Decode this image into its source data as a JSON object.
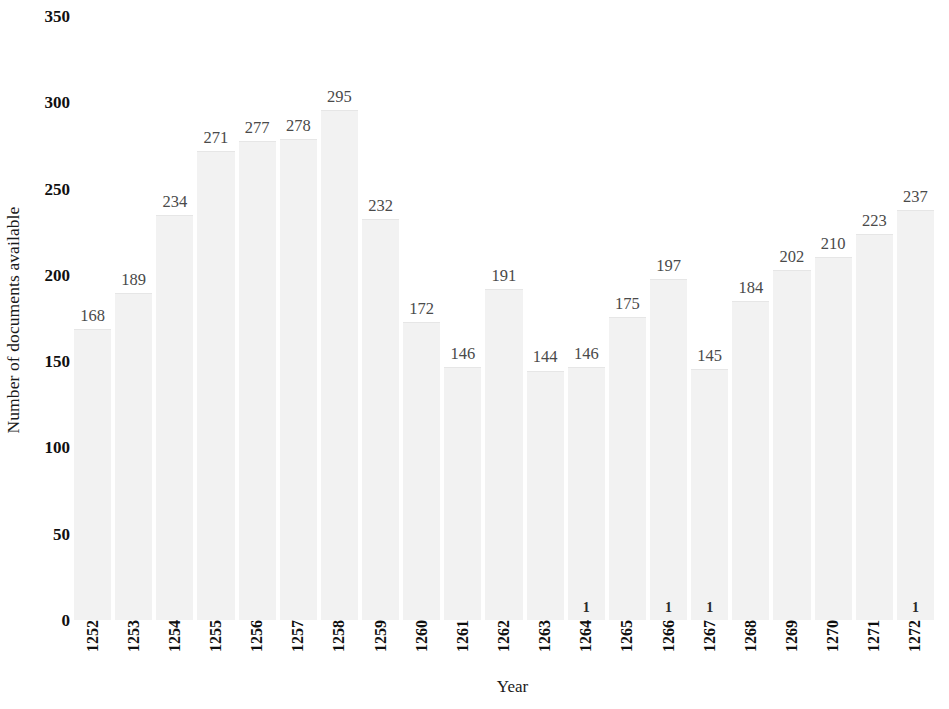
{
  "chart_data": {
    "type": "bar",
    "title": "",
    "subtitle": "",
    "xlabel": "Year",
    "ylabel": "Number of documents available",
    "categories": [
      "1252",
      "1253",
      "1254",
      "1255",
      "1256",
      "1257",
      "1258",
      "1259",
      "1260",
      "1261",
      "1262",
      "1263",
      "1264",
      "1265",
      "1266",
      "1267",
      "1268",
      "1269",
      "1270",
      "1271",
      "1272"
    ],
    "values": [
      168,
      189,
      234,
      271,
      277,
      278,
      295,
      232,
      172,
      146,
      191,
      144,
      146,
      175,
      197,
      145,
      184,
      202,
      210,
      223,
      237
    ],
    "data_labels": [
      "168",
      "189",
      "234",
      "271",
      "277",
      "278",
      "295",
      "232",
      "172",
      "146",
      "191",
      "144",
      "146",
      "175",
      "197",
      "145",
      "184",
      "202",
      "210",
      "223",
      "237"
    ],
    "ylim": [
      0,
      350
    ],
    "yticks": [
      0,
      50,
      100,
      150,
      200,
      250,
      300,
      350
    ],
    "ytick_labels": [
      "0",
      "50",
      "100",
      "150",
      "200",
      "250",
      "300",
      "350"
    ],
    "grid": false,
    "legend": false,
    "legend_position": "none",
    "bar_color": "#f2f2f2",
    "label_color": "#4a4a4a",
    "axis_text_color": "#101010",
    "background_color": "#ffffff",
    "baseline_markers": [
      {
        "category": "1264",
        "label": "1"
      },
      {
        "category": "1266",
        "label": "1"
      },
      {
        "category": "1267",
        "label": "1"
      },
      {
        "category": "1272",
        "label": "1"
      }
    ]
  }
}
